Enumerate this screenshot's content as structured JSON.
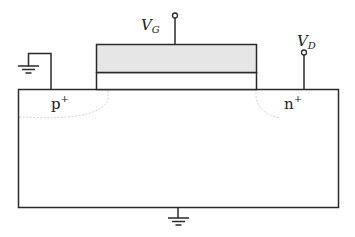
{
  "diagram": {
    "type": "mosfet-cross-section",
    "labels": {
      "gate_voltage": "V",
      "gate_voltage_sub": "G",
      "drain_voltage": "V",
      "drain_voltage_sub": "D",
      "left_region": "p",
      "left_region_sup": "+",
      "right_region": "n",
      "right_region_sup": "+"
    },
    "colors": {
      "line": "#2a2a2a",
      "gate_fill": "#e6e6e6",
      "region_outline": "#d0d0d0",
      "background": "#ffffff"
    }
  }
}
